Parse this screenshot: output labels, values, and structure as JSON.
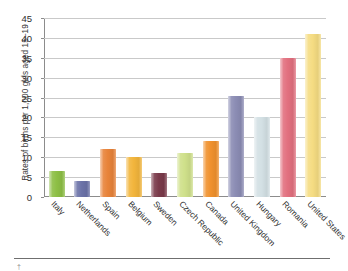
{
  "chart_data": {
    "type": "bar",
    "title": "",
    "subtitle": "",
    "xlabel": "",
    "ylabel": "Rates of births per 1,000 girls aged 15–19",
    "ylim": [
      0,
      45
    ],
    "ytick_step": 5,
    "yticks": [
      45,
      40,
      35,
      30,
      25,
      20,
      15,
      10,
      5,
      0
    ],
    "grid": true,
    "legend": "none",
    "categories": [
      "Italy",
      "Netherlands",
      "Spain",
      "Belgium",
      "Sweden",
      "Czech Republic",
      "Canada",
      "United Kingdom",
      "Hungary",
      "Romania",
      "United States"
    ],
    "values": [
      6.5,
      4.0,
      12.0,
      10.0,
      6.0,
      11.0,
      14.0,
      25.5,
      20.0,
      35.0,
      41.0
    ],
    "bar_colors": [
      "#8dbf45",
      "#6b72a8",
      "#e8833a",
      "#f2b53c",
      "#7a3a4a",
      "#cfe08a",
      "#f0912d",
      "#8b8cb4",
      "#d3e0e4",
      "#e2707f",
      "#f5dc82"
    ]
  }
}
